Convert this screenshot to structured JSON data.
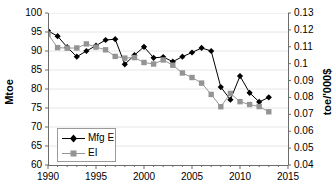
{
  "chart_data": {
    "type": "line",
    "title": "",
    "xlabel": "",
    "ylabel": "Mtoe",
    "y2label": "toe/'000$",
    "grid": true,
    "legend_position": "lower-left-inside",
    "xlim": [
      1990,
      2015
    ],
    "xticks": [
      1990,
      1995,
      2000,
      2005,
      2010,
      2015
    ],
    "xminor_step": 1,
    "ylim": [
      60,
      100
    ],
    "yticks": [
      60,
      65,
      70,
      75,
      80,
      85,
      90,
      95,
      100
    ],
    "y2lim": [
      0.04,
      0.13
    ],
    "y2ticks": [
      0.04,
      0.05,
      0.06,
      0.07,
      0.08,
      0.09,
      0.1,
      0.11,
      0.12,
      0.13
    ],
    "x": [
      1990,
      1991,
      1992,
      1993,
      1994,
      1995,
      1996,
      1997,
      1998,
      1999,
      2000,
      2001,
      2002,
      2003,
      2004,
      2005,
      2006,
      2007,
      2008,
      2009,
      2010,
      2011,
      2012,
      2013
    ],
    "series": [
      {
        "name": "Mfg E",
        "axis": "left",
        "color": "#000000",
        "marker": "diamond",
        "values": [
          95.3,
          93.9,
          91.0,
          88.5,
          90.0,
          91.4,
          92.9,
          93.1,
          86.5,
          88.9,
          91.1,
          88.2,
          88.4,
          87.2,
          88.5,
          89.6,
          90.8,
          90.0,
          80.5,
          77.2,
          83.4,
          79.0,
          76.6,
          77.8
        ]
      },
      {
        "name": "EI",
        "axis": "right",
        "color": "#949494",
        "marker": "square",
        "values": [
          0.1175,
          0.1095,
          0.1092,
          0.1093,
          0.1117,
          0.1098,
          0.1082,
          0.1043,
          0.1033,
          0.1036,
          0.1007,
          0.0998,
          0.1022,
          0.0991,
          0.0945,
          0.0918,
          0.0885,
          0.0818,
          0.0745,
          0.0824,
          0.0775,
          0.0758,
          0.0746,
          0.0715
        ]
      }
    ]
  },
  "legend": {
    "items": [
      {
        "label": "Mfg E"
      },
      {
        "label": "EI"
      }
    ]
  }
}
